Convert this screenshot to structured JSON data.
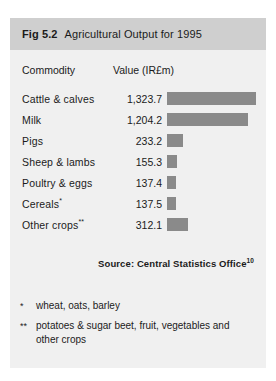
{
  "figure": {
    "number": "Fig 5.2",
    "title": "Agricultural Output for 1995"
  },
  "columns": {
    "commodity": "Commodity",
    "value": "Value (IR£m)"
  },
  "source": {
    "text": "Source: Central Statistics Office",
    "superscript": "10"
  },
  "footnotes": [
    {
      "marker": "*",
      "text": "wheat, oats, barley"
    },
    {
      "marker": "**",
      "text": "potatoes & sugar beet, fruit, vegetables and other crops"
    }
  ],
  "colors": {
    "bar": "#8a8a8a",
    "header_band": "#cfcfcf",
    "panel": "#f0f0f0",
    "text": "#1b1b1b"
  },
  "chart_data": {
    "type": "bar",
    "title": "Agricultural Output for 1995",
    "xlabel": "Value (IR£m)",
    "ylabel": "Commodity",
    "orientation": "horizontal",
    "grid": false,
    "legend": false,
    "xlim": [
      0,
      1400
    ],
    "categories": [
      "Cattle & calves",
      "Milk",
      "Pigs",
      "Sheep & lambs",
      "Poultry & eggs",
      "Cereals*",
      "Other crops**"
    ],
    "values": [
      1323.7,
      1204.2,
      233.2,
      155.3,
      137.4,
      137.5,
      312.1
    ],
    "value_labels": [
      "1,323.7",
      "1,204.2",
      "233.2",
      "155.3",
      "137.4",
      "137.5",
      "312.1"
    ],
    "rows": [
      {
        "label": "Cattle & calves",
        "marker": "",
        "value": 1323.7,
        "value_label": "1,323.7",
        "bar_px": 89
      },
      {
        "label": "Milk",
        "marker": "",
        "value": 1204.2,
        "value_label": "1,204.2",
        "bar_px": 81
      },
      {
        "label": "Pigs",
        "marker": "",
        "value": 233.2,
        "value_label": "233.2",
        "bar_px": 16
      },
      {
        "label": "Sheep & lambs",
        "marker": "",
        "value": 155.3,
        "value_label": "155.3",
        "bar_px": 10
      },
      {
        "label": "Poultry & eggs",
        "marker": "",
        "value": 137.4,
        "value_label": "137.4",
        "bar_px": 9
      },
      {
        "label": "Cereals",
        "marker": "*",
        "value": 137.5,
        "value_label": "137.5",
        "bar_px": 9
      },
      {
        "label": "Other crops",
        "marker": "**",
        "value": 312.1,
        "value_label": "312.1",
        "bar_px": 21
      }
    ]
  }
}
